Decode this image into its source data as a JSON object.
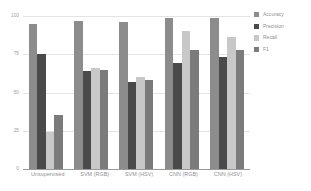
{
  "chart_data": {
    "type": "bar",
    "title": "",
    "xlabel": "",
    "ylabel": "",
    "ylim": [
      0,
      100
    ],
    "yticks": [
      0,
      25,
      50,
      75,
      100
    ],
    "ytick_labels": [
      "0",
      "25",
      "50",
      "75",
      "100"
    ],
    "grid": true,
    "legend_position": "right",
    "categories": [
      "Unsupervised",
      "SVM (RGB)",
      "SVM (HSV)",
      "CNN (RGB)",
      "CNN (HSV)"
    ],
    "series": [
      {
        "name": "Accuracy",
        "color": "#8c8c8c",
        "values": [
          95,
          97,
          96,
          99,
          99
        ]
      },
      {
        "name": "Precision",
        "color": "#4a4a4a",
        "values": [
          75,
          64,
          57,
          69,
          73
        ]
      },
      {
        "name": "Recall",
        "color": "#c8c8c8",
        "values": [
          24,
          66,
          60,
          90,
          86
        ]
      },
      {
        "name": "F1",
        "color": "#7b7b7b",
        "values": [
          35,
          65,
          58,
          78,
          78
        ]
      }
    ]
  },
  "colors": {
    "background": "#ffffff",
    "gridline": "#e4e4e4",
    "axis": "#9a9a9a",
    "tick_text": "#9b9b9b",
    "label_text": "#8f8f8f"
  }
}
